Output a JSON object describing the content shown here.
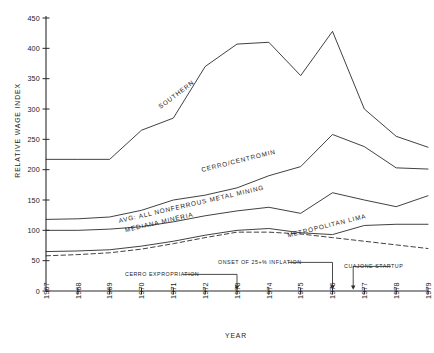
{
  "chart_data": {
    "type": "line",
    "title": "",
    "xlabel": "YEAR",
    "ylabel": "RELATIVE WAGE INDEX",
    "xlim": [
      1967,
      1979
    ],
    "ylim": [
      0,
      450
    ],
    "ytick_step": 50,
    "grid": false,
    "legend": "inline-labels",
    "categories": [
      1967,
      1968,
      1969,
      1970,
      1971,
      1972,
      1973,
      1974,
      1975,
      1976,
      1977,
      1978,
      1979
    ],
    "yticks": [
      0,
      50,
      100,
      150,
      200,
      250,
      300,
      350,
      400,
      450
    ],
    "xticks": [
      "1967",
      "1968",
      "1969",
      "1970",
      "1971",
      "1972",
      "1973",
      "1974",
      "1975",
      "1976",
      "1977",
      "1978",
      "1979"
    ],
    "series": [
      {
        "name": "SOUTHERN",
        "style": "solid",
        "label_x": 1970.6,
        "label_y": 300,
        "label_rotation": -37,
        "values": [
          217,
          217,
          217,
          265,
          285,
          370,
          407,
          410,
          355,
          428,
          300,
          255,
          237
        ]
      },
      {
        "name": "CERRO/CENTROMIN",
        "style": "solid",
        "label_x": 1971.9,
        "label_y": 196,
        "label_rotation": -14,
        "values": [
          118,
          119,
          122,
          133,
          150,
          158,
          170,
          190,
          205,
          258,
          238,
          203,
          201
        ]
      },
      {
        "name": "AVG: ALL NONFERROUS METAL MINING",
        "style": "solid",
        "label_x": 1969.3,
        "label_y": 112,
        "label_rotation": -13,
        "values": [
          100,
          100,
          102,
          106,
          114,
          124,
          132,
          138,
          128,
          162,
          150,
          139,
          157
        ]
      },
      {
        "name": "MEDIANA MINERIA",
        "style": "solid",
        "label_x": 1969.5,
        "label_y": 97,
        "label_rotation": -13,
        "values": [
          65,
          66,
          68,
          74,
          82,
          92,
          100,
          103,
          96,
          93,
          108,
          110,
          110
        ]
      },
      {
        "name": "METROPOLITAN LIMA",
        "style": "dashed",
        "label_x": 1974.6,
        "label_y": 88,
        "label_rotation": -14,
        "values": [
          58,
          60,
          63,
          69,
          78,
          88,
          97,
          97,
          94,
          88,
          82,
          76,
          70
        ]
      }
    ],
    "annotations": [
      {
        "text": "CERRO EXPROPRIATION",
        "year": 1973,
        "text_x": 125,
        "text_y": 276,
        "arrow_to_y": 291
      },
      {
        "text": "ONSET OF 25+% INFLATION",
        "year": 1976,
        "text_x": 218,
        "text_y": 264,
        "arrow_to_y": 291
      },
      {
        "text": "CUAJONE STARTUP",
        "year": 1976.65,
        "text_x": 344,
        "text_y": 268,
        "arrow_to_y": 291
      }
    ]
  }
}
